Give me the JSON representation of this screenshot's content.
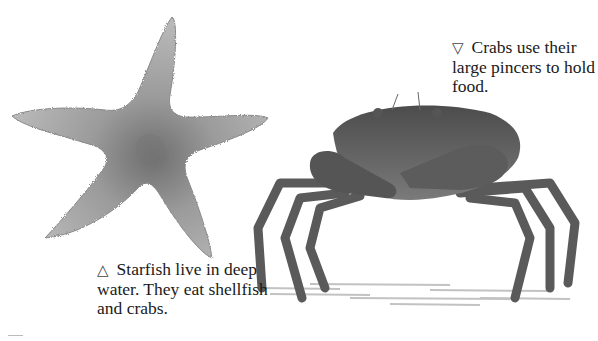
{
  "captions": {
    "crab": {
      "marker": "▽",
      "marker_icon": "triangle-down-icon",
      "text": "Crabs use their large pincers to hold food."
    },
    "starfish": {
      "marker": "△",
      "marker_icon": "triangle-up-icon",
      "text": "Starfish live in deep water. They eat shellfish and crabs."
    }
  },
  "colors": {
    "background": "#ffffff",
    "text": "#1a1a1a",
    "starfish": "#9a9a9a",
    "crab": "#5f5f5f"
  }
}
